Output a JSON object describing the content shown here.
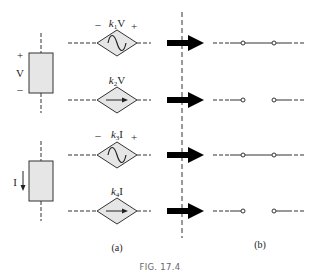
{
  "figure": {
    "caption": "FIG. 17.4",
    "panel_a_label": "(a)",
    "panel_b_label": "(b)"
  },
  "left_elements": [
    {
      "type": "voltage",
      "plus": "+",
      "symbol": "V",
      "minus": "–"
    },
    {
      "type": "current",
      "symbol": "I",
      "arrow": "down"
    }
  ],
  "sources": [
    {
      "id": 1,
      "kind": "voltage-controlled voltage source",
      "minus": "–",
      "coef": "k",
      "sub": "1",
      "var": "V",
      "plus": "+",
      "glyph": "sine"
    },
    {
      "id": 2,
      "kind": "voltage-controlled current source",
      "coef": "k",
      "sub": "2",
      "var": "V",
      "glyph": "arrow"
    },
    {
      "id": 3,
      "kind": "current-controlled voltage source",
      "minus": "–",
      "coef": "k",
      "sub": "3",
      "var": "I",
      "plus": "+",
      "glyph": "sine"
    },
    {
      "id": 4,
      "kind": "current-controlled current source",
      "coef": "k",
      "sub": "4",
      "var": "I",
      "glyph": "arrow"
    }
  ],
  "equivalents": [
    {
      "row": 1,
      "state": "short"
    },
    {
      "row": 2,
      "state": "open"
    },
    {
      "row": 3,
      "state": "short"
    },
    {
      "row": 4,
      "state": "open"
    }
  ],
  "colors": {
    "fill": "#e6e6e6",
    "stroke": "#333333",
    "arrow": "#000000",
    "caption": "#666666"
  }
}
